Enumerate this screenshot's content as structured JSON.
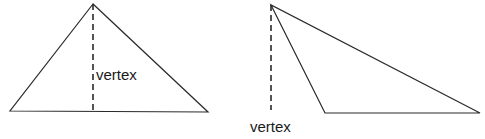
{
  "diagram": {
    "stroke_color": "#2a2a2a",
    "figures": [
      {
        "name": "acute-triangle",
        "vertices": [
          [
            93,
            4
          ],
          [
            10,
            111
          ],
          [
            208,
            112
          ]
        ],
        "altitude": {
          "from": [
            93,
            4
          ],
          "to": [
            93,
            111
          ],
          "style": "dashed"
        },
        "label": {
          "text": "vertex",
          "x": 96,
          "y": 67
        }
      },
      {
        "name": "obtuse-triangle",
        "vertices": [
          [
            271,
            5
          ],
          [
            325,
            113
          ],
          [
            480,
            113
          ]
        ],
        "altitude": {
          "from": [
            271,
            5
          ],
          "to": [
            271,
            110
          ],
          "style": "dashed"
        },
        "label": {
          "text": "vertex",
          "x": 250,
          "y": 119
        }
      }
    ]
  }
}
